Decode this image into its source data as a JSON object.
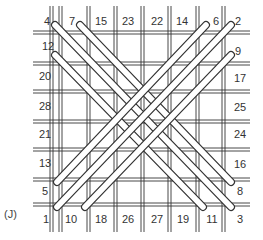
{
  "figure_label": "(J)",
  "colors": {
    "ink": "#333333",
    "rod_fill": "#ffffff",
    "background": "#ffffff"
  },
  "grid": {
    "verticals": [
      50,
      59,
      87,
      114,
      141,
      168,
      196,
      222
    ],
    "horizontals": [
      31,
      62,
      90,
      120,
      148,
      178,
      203
    ]
  },
  "labels": {
    "top": [
      {
        "text": "4",
        "x": 47,
        "y": 15
      },
      {
        "text": "7",
        "x": 72,
        "y": 15
      },
      {
        "text": "15",
        "x": 101,
        "y": 15
      },
      {
        "text": "23",
        "x": 128,
        "y": 15
      },
      {
        "text": "22",
        "x": 157,
        "y": 15
      },
      {
        "text": "14",
        "x": 182,
        "y": 15
      },
      {
        "text": "6",
        "x": 216,
        "y": 15
      },
      {
        "text": "2",
        "x": 238,
        "y": 15
      }
    ],
    "left": [
      {
        "text": "12",
        "x": 48,
        "y": 40
      },
      {
        "text": "20",
        "x": 45,
        "y": 70
      },
      {
        "text": "28",
        "x": 45,
        "y": 100
      },
      {
        "text": "21",
        "x": 45,
        "y": 128
      },
      {
        "text": "13",
        "x": 45,
        "y": 157
      },
      {
        "text": "5",
        "x": 45,
        "y": 185
      }
    ],
    "right": [
      {
        "text": "9",
        "x": 238,
        "y": 45
      },
      {
        "text": "17",
        "x": 240,
        "y": 72
      },
      {
        "text": "25",
        "x": 240,
        "y": 101
      },
      {
        "text": "24",
        "x": 240,
        "y": 128
      },
      {
        "text": "16",
        "x": 240,
        "y": 158
      },
      {
        "text": "8",
        "x": 240,
        "y": 185
      }
    ],
    "bottom": [
      {
        "text": "1",
        "x": 46,
        "y": 213
      },
      {
        "text": "10",
        "x": 71,
        "y": 213
      },
      {
        "text": "18",
        "x": 101,
        "y": 213
      },
      {
        "text": "26",
        "x": 128,
        "y": 213
      },
      {
        "text": "27",
        "x": 157,
        "y": 213
      },
      {
        "text": "19",
        "x": 183,
        "y": 213
      },
      {
        "text": "11",
        "x": 212,
        "y": 213
      },
      {
        "text": "3",
        "x": 240,
        "y": 213
      }
    ]
  },
  "rods": [
    {
      "from": "4",
      "to": "3",
      "x1": 55,
      "y1": 25,
      "x2": 231,
      "y2": 207,
      "dir": "down-right"
    },
    {
      "from": "7",
      "to": "8",
      "x1": 80,
      "y1": 25,
      "x2": 231,
      "y2": 182,
      "dir": "down-right"
    },
    {
      "from": "12",
      "to": "11",
      "x1": 55,
      "y1": 55,
      "x2": 203,
      "y2": 207,
      "dir": "down-right"
    },
    {
      "from": "2",
      "to": "1",
      "x1": 231,
      "y1": 25,
      "x2": 57,
      "y2": 207,
      "dir": "down-left"
    },
    {
      "from": "6",
      "to": "5",
      "x1": 206,
      "y1": 25,
      "x2": 57,
      "y2": 182,
      "dir": "down-left"
    },
    {
      "from": "9",
      "to": "10",
      "x1": 231,
      "y1": 55,
      "x2": 85,
      "y2": 207,
      "dir": "down-left"
    }
  ]
}
